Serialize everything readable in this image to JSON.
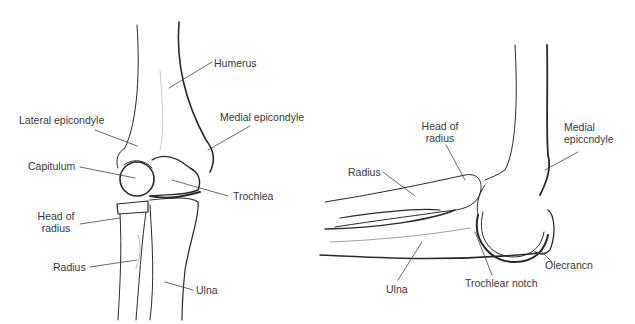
{
  "figures": [
    {
      "view": "anterior",
      "labels": {
        "humerus": "Humerus",
        "lateral_epicondyle": "Lateral epicondyle",
        "medial_epicondyle": "Medial epicondyle",
        "capitulum": "Capitulum",
        "trochlea": "Trochlea",
        "head_of_radius_1": "Head of",
        "head_of_radius_2": "radius",
        "radius": "Radius",
        "ulna": "Ulna"
      }
    },
    {
      "view": "lateral",
      "labels": {
        "head_of_radius_1": "Head of",
        "head_of_radius_2": "radius",
        "medial_epicondyle_1": "Medial",
        "medial_epicondyle_2": "epiccndyle",
        "radius": "Radius",
        "ulna": "Ulna",
        "trochlear_notch": "Trochlear notch",
        "olecranon": "Olecrancn"
      }
    }
  ],
  "colors": {
    "line": "#2a2a2a",
    "leader": "#444444",
    "background": "#ffffff"
  }
}
